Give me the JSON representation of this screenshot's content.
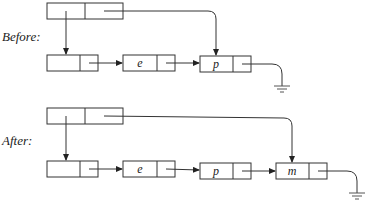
{
  "diagram": {
    "type": "linked-list-append",
    "panels": [
      {
        "label": "Before:",
        "header": {
          "fields": [
            "head",
            "tail"
          ]
        },
        "nodes": [
          {
            "value": ""
          },
          {
            "value": "e"
          },
          {
            "value": "p"
          }
        ],
        "tail_points_to": "p",
        "terminator": "null (ground)"
      },
      {
        "label": "After:",
        "header": {
          "fields": [
            "head",
            "tail"
          ]
        },
        "nodes": [
          {
            "value": ""
          },
          {
            "value": "e"
          },
          {
            "value": "p"
          },
          {
            "value": "m"
          }
        ],
        "tail_points_to": "m",
        "terminator": "null (ground)"
      }
    ]
  }
}
